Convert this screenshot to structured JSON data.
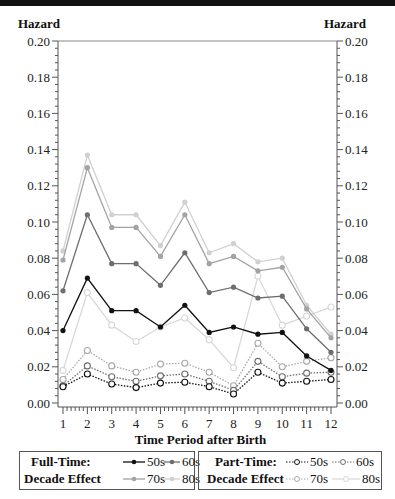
{
  "chart_data": {
    "type": "line",
    "title": "",
    "xlabel": "Time Period after Birth",
    "ylabel": "Hazard",
    "ylabel_right": "Hazard",
    "x": [
      1,
      2,
      3,
      4,
      5,
      6,
      7,
      8,
      9,
      10,
      11,
      12
    ],
    "xlim": [
      1,
      12
    ],
    "ylim": [
      0.0,
      0.2
    ],
    "yticks": [
      "0.00",
      "0.02",
      "0.04",
      "0.06",
      "0.08",
      "0.10",
      "0.12",
      "0.14",
      "0.16",
      "0.18",
      "0.20"
    ],
    "xticks": [
      "1",
      "2",
      "3",
      "4",
      "5",
      "6",
      "7",
      "8",
      "9",
      "10",
      "11",
      "12"
    ],
    "grid": false,
    "legend_position": "bottom",
    "series": [
      {
        "name": "Full-Time 50s",
        "group": "Full-Time",
        "color": "#111111",
        "style": "solid",
        "marker": "filled",
        "values": [
          0.04,
          0.069,
          0.051,
          0.051,
          0.042,
          0.054,
          0.039,
          0.042,
          0.038,
          0.039,
          0.026,
          0.018
        ]
      },
      {
        "name": "Full-Time 60s",
        "group": "Full-Time",
        "color": "#6e6e6e",
        "style": "solid",
        "marker": "filled",
        "values": [
          0.062,
          0.104,
          0.077,
          0.077,
          0.065,
          0.083,
          0.061,
          0.064,
          0.058,
          0.059,
          0.041,
          0.028
        ]
      },
      {
        "name": "Full-Time 70s",
        "group": "Full-Time",
        "color": "#a3a3a3",
        "style": "solid",
        "marker": "filled",
        "values": [
          0.079,
          0.13,
          0.097,
          0.097,
          0.081,
          0.104,
          0.077,
          0.081,
          0.073,
          0.075,
          0.052,
          0.036
        ]
      },
      {
        "name": "Full-Time 80s",
        "group": "Full-Time",
        "color": "#d0d0d0",
        "style": "solid",
        "marker": "filled",
        "values": [
          0.084,
          0.137,
          0.104,
          0.104,
          0.087,
          0.111,
          0.083,
          0.088,
          0.078,
          0.08,
          0.054,
          0.038
        ]
      },
      {
        "name": "Part-Time 50s",
        "group": "Part-Time",
        "color": "#111111",
        "style": "dotted",
        "marker": "open",
        "values": [
          0.009,
          0.016,
          0.0105,
          0.0085,
          0.011,
          0.0115,
          0.009,
          0.005,
          0.017,
          0.011,
          0.012,
          0.013
        ]
      },
      {
        "name": "Part-Time 60s",
        "group": "Part-Time",
        "color": "#6e6e6e",
        "style": "dotted",
        "marker": "open",
        "values": [
          0.0095,
          0.0205,
          0.0145,
          0.012,
          0.015,
          0.016,
          0.012,
          0.007,
          0.023,
          0.0145,
          0.0165,
          0.017
        ]
      },
      {
        "name": "Part-Time 70s",
        "group": "Part-Time",
        "color": "#a8a8a8",
        "style": "dotted",
        "marker": "open",
        "values": [
          0.013,
          0.029,
          0.0205,
          0.017,
          0.0215,
          0.022,
          0.017,
          0.0095,
          0.033,
          0.02,
          0.023,
          0.025
        ]
      },
      {
        "name": "Part-Time 80s",
        "group": "Part-Time",
        "color": "#d8d8d8",
        "style": "solid",
        "marker": "open",
        "values": [
          0.018,
          0.061,
          0.043,
          0.034,
          0.042,
          0.047,
          0.035,
          0.0195,
          0.07,
          0.043,
          0.048,
          0.053
        ]
      }
    ]
  },
  "axes": {
    "left_title": "Hazard",
    "right_title": "Hazard",
    "x_title": "Time Period after Birth"
  },
  "legend": {
    "full_time": {
      "header_line1": "Full-Time:",
      "header_line2": "Decade Effect",
      "entries": [
        {
          "label": "50s",
          "color": "#111111"
        },
        {
          "label": "60s",
          "color": "#6e6e6e"
        },
        {
          "label": "70s",
          "color": "#a3a3a3"
        },
        {
          "label": "80s",
          "color": "#d0d0d0"
        }
      ]
    },
    "part_time": {
      "header_line1": "Part-Time:",
      "header_line2": "Decade  Effect",
      "entries": [
        {
          "label": "50s",
          "color": "#111111"
        },
        {
          "label": "60s",
          "color": "#6e6e6e"
        },
        {
          "label": "70s",
          "color": "#a8a8a8"
        },
        {
          "label": "80s",
          "color": "#d8d8d8"
        }
      ]
    }
  }
}
